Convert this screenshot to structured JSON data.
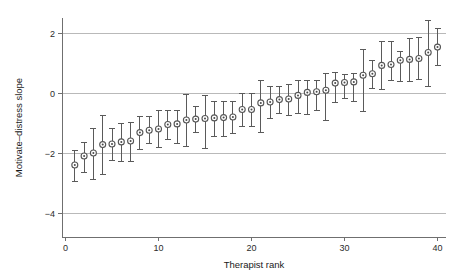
{
  "chart_data": {
    "type": "scatter",
    "title": "",
    "xlabel": "Therapist rank",
    "ylabel": "Motivate–distress slope",
    "xlim": [
      0,
      41
    ],
    "ylim": [
      -4,
      2.6
    ],
    "xticks": [
      0,
      10,
      20,
      30,
      40
    ],
    "xticklabels": [
      "0",
      "10",
      "20",
      "30",
      "40"
    ],
    "yticks": [
      2,
      0,
      -2,
      -4
    ],
    "yticklabels": [
      "2",
      "0",
      "−2",
      "−4"
    ],
    "grid": "horizontal",
    "legend": "none",
    "error_bar_style": "vertical-with-caps",
    "marker_style": "circle-with-dot",
    "series": [
      {
        "name": "Motivate-distress slope by therapist",
        "x": [
          1,
          2,
          3,
          4,
          5,
          6,
          7,
          8,
          9,
          10,
          11,
          12,
          13,
          14,
          15,
          16,
          17,
          18,
          19,
          20,
          21,
          22,
          23,
          24,
          25,
          26,
          27,
          28,
          29,
          30,
          31,
          32,
          33,
          34,
          35,
          36,
          37,
          38,
          39,
          40
        ],
        "values": [
          -2.4,
          -2.1,
          -2.0,
          -1.72,
          -1.7,
          -1.63,
          -1.6,
          -1.32,
          -1.24,
          -1.2,
          -1.05,
          -1.03,
          -0.9,
          -0.87,
          -0.85,
          -0.83,
          -0.82,
          -0.8,
          -0.55,
          -0.55,
          -0.33,
          -0.3,
          -0.22,
          -0.2,
          -0.08,
          0.02,
          0.04,
          0.09,
          0.33,
          0.35,
          0.37,
          0.59,
          0.64,
          0.92,
          0.95,
          1.09,
          1.12,
          1.15,
          1.35,
          1.53
        ],
        "lower": [
          -2.92,
          -2.62,
          -2.85,
          -2.7,
          -2.22,
          -2.25,
          -2.28,
          -1.88,
          -1.68,
          -1.8,
          -1.52,
          -1.65,
          -1.75,
          -1.3,
          -1.83,
          -1.42,
          -1.42,
          -1.32,
          -1.1,
          -1.1,
          -1.3,
          -0.82,
          -0.65,
          -0.72,
          -0.68,
          -0.7,
          -0.58,
          -0.9,
          -0.3,
          -0.18,
          -0.28,
          -0.6,
          0.18,
          0.15,
          0.45,
          0.4,
          0.4,
          0.48,
          0.22,
          0.92
        ],
        "upper": [
          -1.9,
          -1.62,
          -1.18,
          -0.72,
          -1.15,
          -1.0,
          -0.95,
          -0.78,
          -0.78,
          -0.58,
          -0.55,
          -0.58,
          -0.02,
          -0.42,
          -0.05,
          -0.25,
          -0.28,
          -0.28,
          0.0,
          0.0,
          0.45,
          0.25,
          0.22,
          0.3,
          0.42,
          0.45,
          0.42,
          0.68,
          0.7,
          0.65,
          0.68,
          1.48,
          1.1,
          1.72,
          1.72,
          1.4,
          1.82,
          1.88,
          2.42,
          2.18
        ]
      }
    ]
  },
  "axes": {
    "y_title": "Motivate–distress slope",
    "x_title": "Therapist rank"
  },
  "colors": {
    "marker_stroke": "#555555",
    "marker_fill": "#ffffff",
    "marker_dot": "#4a4a4a",
    "error_bar": "#5a5a5a",
    "gridline": "#b9b9b9",
    "axis": "#6f6f6f",
    "background": "#ffffff",
    "text": "#1a1a1a"
  }
}
